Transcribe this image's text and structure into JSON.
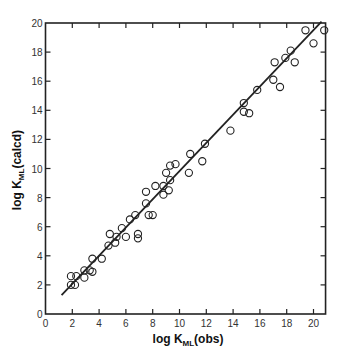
{
  "chart_data": {
    "type": "scatter",
    "title": "",
    "xlabel": "log K_ML(obs)",
    "ylabel": "log K_ML(calcd)",
    "xlabel_parts": {
      "main": "log K",
      "sub": "ML",
      "suffix": "(obs)"
    },
    "ylabel_parts": {
      "main": "log K",
      "sub": "ML",
      "suffix": "(calcd)"
    },
    "xlim": [
      0,
      20.9
    ],
    "ylim": [
      0,
      20
    ],
    "xticks": [
      0,
      2,
      4,
      6,
      8,
      10,
      12,
      14,
      16,
      18,
      20
    ],
    "yticks": [
      0,
      2,
      4,
      6,
      8,
      10,
      12,
      14,
      16,
      18,
      20
    ],
    "xtick_labels": [
      "0",
      "2",
      "4",
      "6",
      "8",
      "10",
      "12",
      "14",
      "16",
      "18",
      "20"
    ],
    "ytick_labels": [
      "0",
      "2",
      "4",
      "6",
      "8",
      "10",
      "12",
      "14",
      "16",
      "18",
      "20"
    ],
    "grid": false,
    "legend": null,
    "marker": "open-circle",
    "fit_line": {
      "x": [
        1.2,
        20.6
      ],
      "y": [
        1.3,
        20.1
      ]
    },
    "points": [
      [
        1.9,
        2.0
      ],
      [
        1.9,
        2.6
      ],
      [
        2.2,
        2.0
      ],
      [
        2.3,
        2.6
      ],
      [
        2.9,
        3.0
      ],
      [
        2.9,
        2.5
      ],
      [
        3.3,
        3.0
      ],
      [
        3.5,
        2.9
      ],
      [
        3.5,
        3.8
      ],
      [
        4.2,
        3.8
      ],
      [
        4.7,
        4.7
      ],
      [
        4.8,
        5.5
      ],
      [
        5.2,
        4.9
      ],
      [
        5.3,
        5.3
      ],
      [
        5.7,
        5.9
      ],
      [
        6.0,
        5.3
      ],
      [
        6.3,
        6.5
      ],
      [
        6.7,
        6.8
      ],
      [
        6.9,
        5.5
      ],
      [
        6.9,
        5.2
      ],
      [
        7.5,
        7.6
      ],
      [
        7.5,
        8.4
      ],
      [
        7.7,
        6.8
      ],
      [
        8.0,
        6.8
      ],
      [
        8.2,
        8.8
      ],
      [
        8.8,
        8.2
      ],
      [
        8.8,
        8.8
      ],
      [
        9.0,
        9.7
      ],
      [
        9.2,
        8.5
      ],
      [
        9.3,
        9.2
      ],
      [
        9.3,
        10.2
      ],
      [
        9.7,
        10.3
      ],
      [
        10.8,
        11.0
      ],
      [
        10.7,
        9.7
      ],
      [
        11.9,
        11.7
      ],
      [
        11.7,
        10.5
      ],
      [
        13.8,
        12.6
      ],
      [
        14.8,
        14.5
      ],
      [
        14.8,
        13.9
      ],
      [
        15.2,
        13.8
      ],
      [
        15.8,
        15.4
      ],
      [
        17.0,
        16.1
      ],
      [
        17.5,
        15.6
      ],
      [
        17.1,
        17.3
      ],
      [
        17.9,
        17.6
      ],
      [
        18.3,
        18.1
      ],
      [
        18.6,
        17.3
      ],
      [
        19.4,
        19.5
      ],
      [
        20.0,
        18.6
      ],
      [
        20.8,
        19.5
      ]
    ]
  },
  "colors": {
    "ink": "#222222",
    "background": "#ffffff"
  }
}
